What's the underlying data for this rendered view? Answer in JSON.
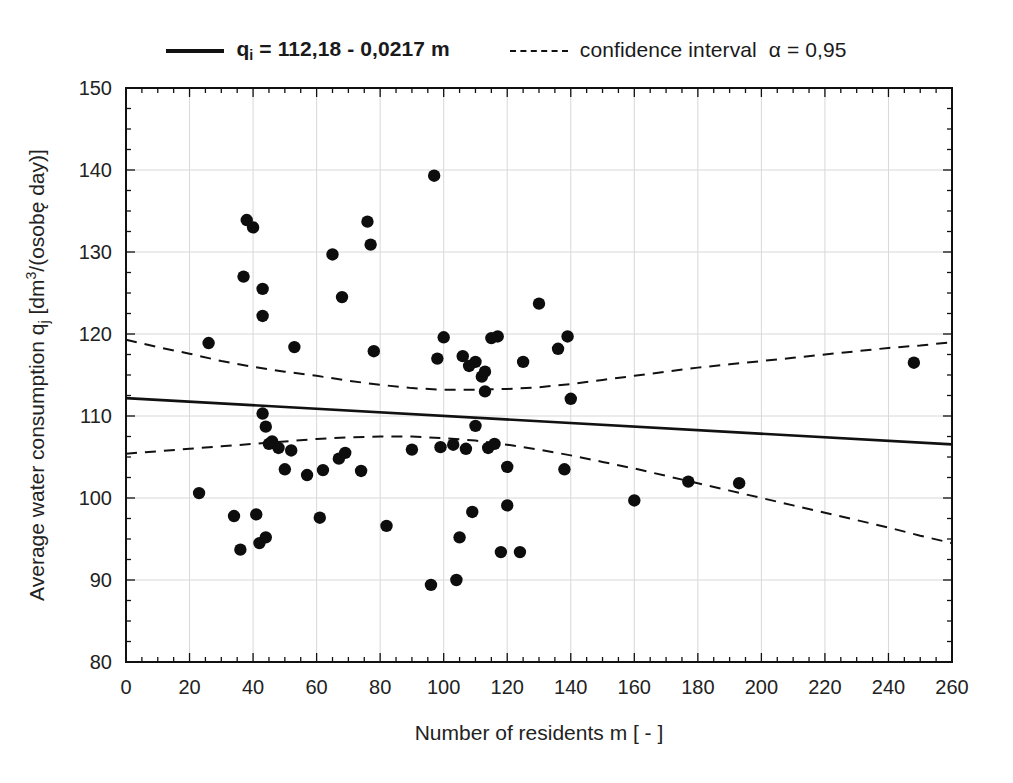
{
  "legend": {
    "items": [
      {
        "style": "solid",
        "label_prefix": "q",
        "label_sub": "i",
        "label_rest": " = 112,18 - 0,0217 m",
        "bold": true,
        "name": "regression-line"
      },
      {
        "style": "dashed",
        "label": "confidence interval",
        "alpha": "α = 0,95",
        "bold": false,
        "name": "confidence-interval"
      }
    ]
  },
  "chart_data": {
    "type": "scatter",
    "title": "",
    "xlabel": "Number of residents m [ - ]",
    "ylabel": "Average water consumption q_j [dm3/(osobę day)]",
    "ylabel_parts": {
      "lead": "Average water consumption ",
      "symbol": "q",
      "symbol_sub": "j",
      "unit_open": " [dm",
      "unit_sup": "3",
      "unit_rest": "/(osobę day)]"
    },
    "xlim": [
      0,
      260
    ],
    "ylim": [
      80,
      150
    ],
    "xticks": [
      0,
      20,
      40,
      60,
      80,
      100,
      120,
      140,
      160,
      180,
      200,
      220,
      240,
      260
    ],
    "yticks": [
      80,
      90,
      100,
      110,
      120,
      130,
      140,
      150
    ],
    "grid": true,
    "minor_ticks": true,
    "legend_position": "above-plot",
    "regression": {
      "equation": "q_i = 112,18 - 0,0217 m",
      "intercept": 112.18,
      "slope": -0.0217,
      "style": "solid"
    },
    "confidence_interval": {
      "alpha": 0.95,
      "style": "dashed",
      "upper": [
        [
          0,
          119.3
        ],
        [
          10,
          118.4
        ],
        [
          20,
          117.6
        ],
        [
          30,
          116.7
        ],
        [
          40,
          116.0
        ],
        [
          50,
          115.4
        ],
        [
          60,
          114.9
        ],
        [
          70,
          114.3
        ],
        [
          80,
          113.8
        ],
        [
          90,
          113.4
        ],
        [
          100,
          113.2
        ],
        [
          110,
          113.2
        ],
        [
          120,
          113.3
        ],
        [
          130,
          113.5
        ],
        [
          140,
          113.9
        ],
        [
          150,
          114.4
        ],
        [
          160,
          114.9
        ],
        [
          170,
          115.4
        ],
        [
          180,
          115.9
        ],
        [
          190,
          116.3
        ],
        [
          200,
          116.7
        ],
        [
          210,
          117.1
        ],
        [
          220,
          117.5
        ],
        [
          230,
          117.9
        ],
        [
          240,
          118.3
        ],
        [
          250,
          118.6
        ],
        [
          260,
          119.0
        ]
      ],
      "lower": [
        [
          0,
          105.4
        ],
        [
          10,
          105.7
        ],
        [
          20,
          106.0
        ],
        [
          30,
          106.3
        ],
        [
          40,
          106.6
        ],
        [
          50,
          106.9
        ],
        [
          60,
          107.2
        ],
        [
          70,
          107.4
        ],
        [
          80,
          107.5
        ],
        [
          90,
          107.5
        ],
        [
          100,
          107.3
        ],
        [
          110,
          107.0
        ],
        [
          120,
          106.5
        ],
        [
          130,
          105.9
        ],
        [
          140,
          105.2
        ],
        [
          150,
          104.4
        ],
        [
          160,
          103.6
        ],
        [
          170,
          102.7
        ],
        [
          180,
          101.8
        ],
        [
          190,
          100.9
        ],
        [
          200,
          100.0
        ],
        [
          210,
          99.1
        ],
        [
          220,
          98.2
        ],
        [
          230,
          97.3
        ],
        [
          240,
          96.4
        ],
        [
          250,
          95.4
        ],
        [
          260,
          94.5
        ]
      ]
    },
    "points": [
      [
        23,
        100.6
      ],
      [
        26,
        118.9
      ],
      [
        34,
        97.8
      ],
      [
        36,
        93.7
      ],
      [
        37,
        127.0
      ],
      [
        38,
        133.9
      ],
      [
        40,
        133.0
      ],
      [
        41,
        98.0
      ],
      [
        42,
        94.5
      ],
      [
        43,
        125.5
      ],
      [
        43,
        110.3
      ],
      [
        43,
        122.2
      ],
      [
        44,
        108.7
      ],
      [
        44,
        95.2
      ],
      [
        45,
        106.6
      ],
      [
        46,
        106.9
      ],
      [
        48,
        106.1
      ],
      [
        50,
        103.5
      ],
      [
        52,
        105.8
      ],
      [
        53,
        118.4
      ],
      [
        57,
        102.8
      ],
      [
        61,
        97.6
      ],
      [
        62,
        103.4
      ],
      [
        65,
        129.7
      ],
      [
        67,
        104.8
      ],
      [
        68,
        124.5
      ],
      [
        69,
        105.5
      ],
      [
        74,
        103.3
      ],
      [
        76,
        133.7
      ],
      [
        77,
        130.9
      ],
      [
        78,
        117.9
      ],
      [
        82,
        96.6
      ],
      [
        90,
        105.9
      ],
      [
        96,
        89.4
      ],
      [
        97,
        139.3
      ],
      [
        98,
        117.0
      ],
      [
        99,
        106.2
      ],
      [
        100,
        119.6
      ],
      [
        103,
        106.5
      ],
      [
        104,
        90.0
      ],
      [
        105,
        95.2
      ],
      [
        106,
        117.3
      ],
      [
        107,
        106.0
      ],
      [
        108,
        116.1
      ],
      [
        109,
        98.3
      ],
      [
        110,
        116.6
      ],
      [
        110,
        108.8
      ],
      [
        112,
        114.8
      ],
      [
        113,
        113.0
      ],
      [
        113,
        115.4
      ],
      [
        114,
        106.1
      ],
      [
        115,
        119.5
      ],
      [
        116,
        106.6
      ],
      [
        117,
        119.7
      ],
      [
        118,
        93.4
      ],
      [
        120,
        103.8
      ],
      [
        120,
        99.1
      ],
      [
        124,
        93.4
      ],
      [
        125,
        116.6
      ],
      [
        130,
        123.7
      ],
      [
        136,
        118.2
      ],
      [
        138,
        103.5
      ],
      [
        139,
        119.7
      ],
      [
        140,
        112.1
      ],
      [
        160,
        99.7
      ],
      [
        177,
        102.0
      ],
      [
        193,
        101.8
      ],
      [
        248,
        116.5
      ]
    ]
  },
  "colors": {
    "ink": "#111111",
    "grid": "#d8d8d8",
    "point": "#0d0d0d",
    "background": "#ffffff"
  }
}
